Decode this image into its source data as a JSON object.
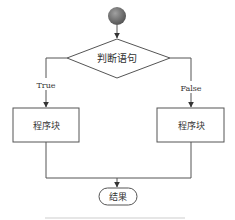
{
  "diagram": {
    "type": "flowchart",
    "start": {
      "shape": "circle",
      "color": "#7a7a7a"
    },
    "decision": {
      "label": "判断语句"
    },
    "branches": {
      "true": {
        "label": "True",
        "block_label": "程序块"
      },
      "false": {
        "label": "False",
        "block_label": "程序块"
      }
    },
    "end": {
      "label": "结果"
    },
    "colors": {
      "line": "#555555",
      "text": "#333333",
      "background": "#ffffff"
    }
  }
}
